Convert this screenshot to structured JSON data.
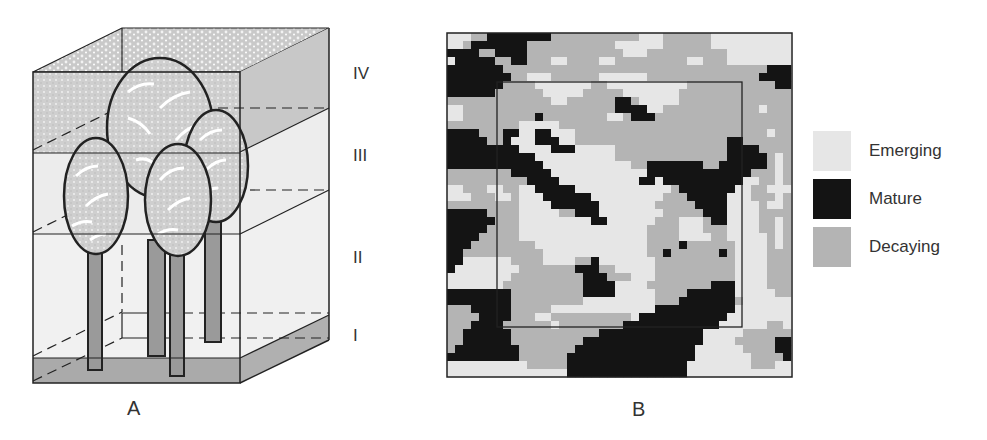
{
  "panels": {
    "a": {
      "label": "A",
      "title": "Forest stand layers"
    },
    "b": {
      "label": "B",
      "title": "Patch mosaic map"
    }
  },
  "layers": [
    {
      "id": "IV",
      "label": "IV"
    },
    {
      "id": "III",
      "label": "III"
    },
    {
      "id": "II",
      "label": "II"
    },
    {
      "id": "I",
      "label": "I"
    }
  ],
  "legend": [
    {
      "key": "E",
      "label": "Emerging",
      "color": "#e6e6e6"
    },
    {
      "key": "M",
      "label": "Mature",
      "color": "#141414"
    },
    {
      "key": "D",
      "label": "Decaying",
      "color": "#b4b4b4"
    }
  ],
  "colors": {
    "line": "#222222",
    "layer_top": "#c8c8c8",
    "layer_mid": "#ececec",
    "ground": "#a9a9a9",
    "crown": "#c4c4c4",
    "trunk": "#9a9a9a"
  },
  "map": {
    "cell_px": 8,
    "origin": [
      447,
      33
    ],
    "rows": [
      "EEEDDMMMMMMMMDDDDDDDDDDDEEEDDDDDDEEEEEEEEEE",
      "EEDMMMMMMMDDDDDDDDDDDEEEEEEDDDDDDEEEEEEEEEE",
      "MMMMDDMMMMDDDDDDDDDDDDEEEDDDDDDDDDDEEEEEEEE",
      "EMMMMMDDMMDDDEEDDDDEEDDDDDDDDDEEDDDEEEEEEEE",
      "MMMMMMMDDDDDDDDDDDDDDDDDDDDDDDDDDDDDDDDDMMM",
      "MMMMMMMMDDEEEDDDDDDEEEEEEDDDDDDDDDDDDDDMMMM",
      "MMMMMMMDDDDEEEEEEEDDEEEEEEEEEEDDDDDDDDDDDMM",
      "MMMMMMDDDDDDEEEEEDDDDDEEEEEEEDDDDDDDDDDDDDD",
      "DDDDDDDDDDDDDEEDDDDDDMMDEEEEEDDDDDDDDDDDDDD",
      "EEDDDDDDDDDDDDDDDDDDDMMMMEEDDDDDDDDDDDDEDDD",
      "EEDDDDDDDDDMDDDDDDDDEEDMMMDDDDDDDDDDDDDDDDD",
      "DDDDDDDDDEEEEEDDDDDDDDDDDDDDDDDDDDDDDDDDDDD",
      "MMMMDDDMMEEMMEEEDDDDDDDDDDDDDDDDDDDDDDDDEDD",
      "MMMMMDDMEEEMMMEEDDDDDDDDDDDDDDDDDDDMMDDDDDD",
      "MMMMMMMMMEEEEMMMEEEEEDDDDDDDDDDDDDDMMMMDDDD",
      "MMMMMMMMMMMEEEEEEEEEEDDDDDDDDDDDDDDMMMMMDED",
      "MMMMMMMMMMMMEEEEEEEEEEEDDMMMMMMMDDMMMMMMDED",
      "DDDDDDDDMMMMMEEEEEEEEEEEEMMMMMMMMMMMMMDDDED",
      "DDDDDDDDDDMMMMEEEEEEEEEEMMEMMMMMMMMMMEEDDED",
      "EEDDDEEDDEEMMMMMEEEEEEEEEEEEDMMMMMMMEEDDEEE",
      "EEEDDDEEDEEEMMMMMMEEEEEEEEEDDDMMMMMEEEDDDED",
      "DDDDDDDDDEEEEMMMMMMEEEEEEEDDDDDMMMMEEEEDEED",
      "MMMMMDDDDEEEEEDDMMMEEEEEEEEDDDDDMMMEEEEDDDD",
      "MMMMMMDDDEEEEEEEEEMMEEEEEEDDDEEEDMMEEEEDDED",
      "MMMMMDDDDEEEEEEEEEEEEEEEEDDDDEEEDDDEEEEDDED",
      "MMMMDDDDDEEEEEEEEEEEEEEEEDDDDEEEEDDEEEEEDED",
      "MMMDDDDDDDDEEEEEEEEEEEEEEDDDDMDDDDDDEEEEDED",
      "MMDDDDDDDDDDEEEEEEEEEEEEEDDMDDDDDDMDEEEEDDD",
      "MMEEEEEEDDDDEEEEDDMEEEEEEEDDDDDDDDDDEEEEDDD",
      "MEEEEEEEEDDDDDDDMMMDDEEEEEDDDDDDDDDDEEEEDDD",
      "EEEEEEEEDDDDDDDDDMMMDDDEEEDDDDDDDDDDEEEEDDD",
      "EEEEEEEDDDDDDDDDDMMMMEEEEDDDDDDDDMMMEEEEDDD",
      "MMMMMMMMDDDDDDDDDMMMMEEEEEDDDDMMMMMMEEEEEDD",
      "MMMMMMMMDDDDDDDDDEEEEEEEEEDDDMMMMMMMDEEEEEE",
      "DDDMMMMMDDDDDEEEEEEEEEEEEEMMMMMMMMMMEEEEEEE",
      "DDDDMMMMDDDEEDDDDDDDDDDEMMMMMMMMMMMEEEEEEEE",
      "DDDMMMMDDDDDDEDDDDDDDDMMMMMMMMMMMMEEEEEEDDE",
      "DDMMMMMMDDDDDDDDDDDMMMMMMMMMMMMMEEEEEDDDDDD",
      "DDMMMMMMDDDDDDDDDMMMMMMMMMMMMMMMEEEEDDDDDMM",
      "DMMMMMMMMDDDDDDDMMMMMMMMMMMMMMMEEEEEEDDDDMM",
      "MMMMMMMMMDDDDDDMMMMMMMMMMMMMMMMEEEEEEEDDDDM",
      "EEEEEEEEEEDDDDDMMMMMMMMMMMMMMMEEEEEEEEDDDEE",
      "EEEEEEEEEEEEEEEMMMMMMMMMMMMMMMEEEEEEEEEEEEE"
    ]
  }
}
